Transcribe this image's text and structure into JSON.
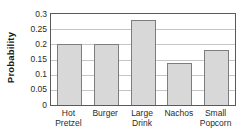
{
  "chart_data": {
    "type": "bar",
    "title": "",
    "xlabel": "",
    "ylabel": "Probability",
    "categories": [
      "Hot Pretzel",
      "Burger",
      "Large Drink",
      "Nachos",
      "Small Popcorn"
    ],
    "values": [
      0.2,
      0.2,
      0.28,
      0.14,
      0.18
    ],
    "ylim": [
      0,
      0.3
    ],
    "yticks": [
      0,
      0.05,
      0.1,
      0.15,
      0.2,
      0.25,
      0.3
    ],
    "ytick_labels": [
      "0",
      "0.05",
      "0.1",
      "0.15",
      "0.2",
      "0.25",
      "0.3"
    ],
    "grid": true,
    "legend": "none",
    "colors": {
      "bar_fill": "#d8d8d8",
      "bar_border": "#7d7d7d",
      "gridline": "#c6c6c6",
      "plot_border": "#5a5a5a",
      "text": "#2a2a2a",
      "background": "#ffffff"
    }
  }
}
